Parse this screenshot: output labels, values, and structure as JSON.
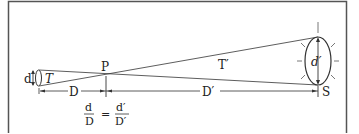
{
  "figure": {
    "labels": {
      "eye_diameter": "d",
      "eye_triangle": "T",
      "pinhole_point": "P",
      "sun_triangle": "T′",
      "sun_diameter": "d′",
      "near_distance": "D",
      "far_distance": "D′",
      "sun_point": "S"
    },
    "formula": {
      "left_num": "d",
      "left_den": "D",
      "equals": "=",
      "right_num": "d′",
      "right_den": "D′"
    },
    "colors": {
      "stroke": "#333333",
      "frame": "#555555",
      "background": "#ffffff"
    }
  }
}
